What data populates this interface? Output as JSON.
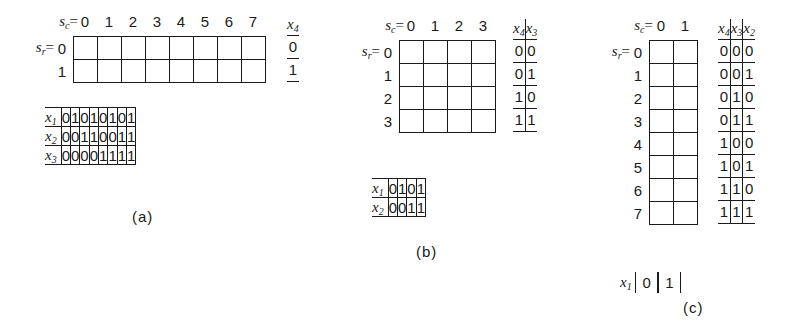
{
  "figure": {
    "parts": [
      {
        "id": "a",
        "caption": "(a)",
        "col_selector_label": "s",
        "col_selector_sub": "c",
        "row_selector_label": "s",
        "row_selector_sub": "r",
        "eq": "=",
        "column_headers": [
          "0",
          "1",
          "2",
          "3",
          "4",
          "5",
          "6",
          "7"
        ],
        "row_headers": [
          "0",
          "1"
        ],
        "grid": {
          "cols": 8,
          "rows": 2
        },
        "side_table": {
          "headers": [
            "x4"
          ],
          "header_labels": [
            {
              "base": "x",
              "sub": "4"
            }
          ],
          "rows": [
            [
              "0"
            ],
            [
              "1"
            ]
          ]
        },
        "bottom_table": {
          "row_labels": [
            {
              "base": "x",
              "sub": "1"
            },
            {
              "base": "x",
              "sub": "2"
            },
            {
              "base": "x",
              "sub": "3"
            }
          ],
          "rows": [
            [
              "0",
              "1",
              "0",
              "1",
              "0",
              "1",
              "0",
              "1"
            ],
            [
              "0",
              "0",
              "1",
              "1",
              "0",
              "0",
              "1",
              "1"
            ],
            [
              "0",
              "0",
              "0",
              "0",
              "1",
              "1",
              "1",
              "1"
            ]
          ]
        }
      },
      {
        "id": "b",
        "caption": "(b)",
        "col_selector_label": "s",
        "col_selector_sub": "c",
        "row_selector_label": "s",
        "row_selector_sub": "r",
        "eq": "=",
        "column_headers": [
          "0",
          "1",
          "2",
          "3"
        ],
        "row_headers": [
          "0",
          "1",
          "2",
          "3"
        ],
        "grid": {
          "cols": 4,
          "rows": 4
        },
        "side_table": {
          "headers": [
            "x4",
            "x3"
          ],
          "header_labels": [
            {
              "base": "x",
              "sub": "4"
            },
            {
              "base": "x",
              "sub": "3"
            }
          ],
          "rows": [
            [
              "0",
              "0"
            ],
            [
              "0",
              "1"
            ],
            [
              "1",
              "0"
            ],
            [
              "1",
              "1"
            ]
          ]
        },
        "bottom_table": {
          "row_labels": [
            {
              "base": "x",
              "sub": "1"
            },
            {
              "base": "x",
              "sub": "2"
            }
          ],
          "rows": [
            [
              "0",
              "1",
              "0",
              "1"
            ],
            [
              "0",
              "0",
              "1",
              "1"
            ]
          ]
        }
      },
      {
        "id": "c",
        "caption": "(c)",
        "col_selector_label": "s",
        "col_selector_sub": "c",
        "row_selector_label": "s",
        "row_selector_sub": "r",
        "eq": "=",
        "column_headers": [
          "0",
          "1"
        ],
        "row_headers": [
          "0",
          "1",
          "2",
          "3",
          "4",
          "5",
          "6",
          "7"
        ],
        "grid": {
          "cols": 2,
          "rows": 8
        },
        "side_table": {
          "headers": [
            "x4",
            "x3",
            "x2"
          ],
          "header_labels": [
            {
              "base": "x",
              "sub": "4"
            },
            {
              "base": "x",
              "sub": "3"
            },
            {
              "base": "x",
              "sub": "2"
            }
          ],
          "rows": [
            [
              "0",
              "0",
              "0"
            ],
            [
              "0",
              "0",
              "1"
            ],
            [
              "0",
              "1",
              "0"
            ],
            [
              "0",
              "1",
              "1"
            ],
            [
              "1",
              "0",
              "0"
            ],
            [
              "1",
              "0",
              "1"
            ],
            [
              "1",
              "1",
              "0"
            ],
            [
              "1",
              "1",
              "1"
            ]
          ]
        },
        "bottom_strip": {
          "label": {
            "base": "x",
            "sub": "1"
          },
          "values": [
            "0",
            "1"
          ]
        }
      }
    ]
  },
  "colors": {
    "ink": "#1a1a1a",
    "paper": "#ffffff"
  }
}
